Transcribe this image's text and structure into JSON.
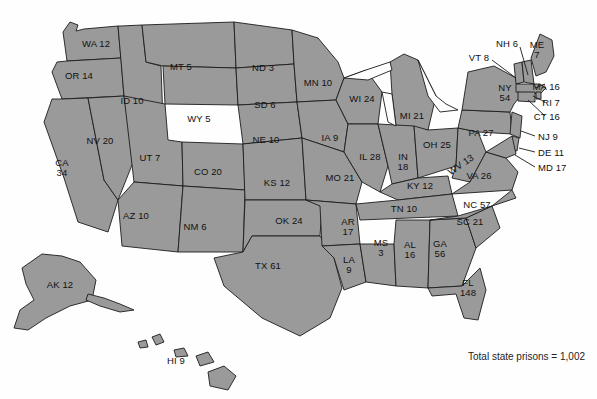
{
  "figure": {
    "caption": "Total state prisons = 1,002",
    "caption_x": 468,
    "caption_y": 351,
    "fill_color": "#9a9a9a",
    "border_color": "#1c1c1c",
    "background_color": "#fefefe",
    "water_color": "#fdfdfd"
  },
  "chart_data": {
    "type": "map",
    "title": "Total state prisons = 1,002",
    "subtitle": "",
    "xlabel": "",
    "ylabel": "",
    "value_unit": "state prisons",
    "total": 1002,
    "total_label": "Total state prisons = 1,002",
    "legend": "none",
    "grid": false,
    "projection": "albers-usa",
    "categories": [
      "AL",
      "AK",
      "AZ",
      "AR",
      "CA",
      "CO",
      "CT",
      "DE",
      "FL",
      "GA",
      "HI",
      "ID",
      "IL",
      "IN",
      "IA",
      "KS",
      "KY",
      "LA",
      "ME",
      "MD",
      "MA",
      "MI",
      "MN",
      "MS",
      "MO",
      "MT",
      "NE",
      "NV",
      "NH",
      "NJ",
      "NM",
      "NY",
      "NC",
      "ND",
      "OH",
      "OK",
      "OR",
      "PA",
      "RI",
      "SC",
      "SD",
      "TN",
      "TX",
      "UT",
      "VT",
      "VA",
      "WA",
      "WV",
      "WI",
      "WY"
    ],
    "values": [
      16,
      12,
      10,
      17,
      34,
      20,
      16,
      11,
      148,
      56,
      9,
      10,
      28,
      18,
      9,
      12,
      12,
      9,
      7,
      17,
      16,
      21,
      10,
      3,
      21,
      5,
      10,
      20,
      6,
      9,
      6,
      54,
      57,
      3,
      25,
      24,
      14,
      27,
      7,
      21,
      6,
      10,
      61,
      7,
      8,
      26,
      12,
      13,
      24,
      5
    ]
  },
  "states": [
    {
      "id": "WA",
      "label": "WA 12",
      "value": 12,
      "x": 96,
      "y": 44,
      "anchor": "ctr",
      "leader": null
    },
    {
      "id": "OR",
      "label": "OR 14",
      "value": 14,
      "x": 79,
      "y": 76,
      "anchor": "ctr",
      "leader": null
    },
    {
      "id": "CA",
      "label": "CA\n34",
      "value": 34,
      "x": 62,
      "y": 168,
      "anchor": "ctr",
      "leader": null
    },
    {
      "id": "NV",
      "label": "NV 20",
      "value": 20,
      "x": 100,
      "y": 141,
      "anchor": "ctr",
      "leader": null
    },
    {
      "id": "ID",
      "label": "ID 10",
      "value": 10,
      "x": 132,
      "y": 101,
      "anchor": "ctr",
      "leader": null
    },
    {
      "id": "MT",
      "label": "MT 5",
      "value": 5,
      "x": 181,
      "y": 67,
      "anchor": "ctr",
      "leader": null
    },
    {
      "id": "WY",
      "label": "WY 5",
      "value": 5,
      "x": 199,
      "y": 119,
      "anchor": "ctr",
      "leader": null
    },
    {
      "id": "UT",
      "label": "UT 7",
      "value": 7,
      "x": 150,
      "y": 158,
      "anchor": "ctr",
      "leader": null
    },
    {
      "id": "AZ",
      "label": "AZ 10",
      "value": 10,
      "x": 136,
      "y": 216,
      "anchor": "ctr",
      "leader": null
    },
    {
      "id": "CO",
      "label": "CO 20",
      "value": 20,
      "x": 208,
      "y": 172,
      "anchor": "ctr",
      "leader": null
    },
    {
      "id": "NM",
      "label": "NM 6",
      "value": 6,
      "x": 195,
      "y": 227,
      "anchor": "ctr",
      "leader": null
    },
    {
      "id": "ND",
      "label": "ND 3",
      "value": 3,
      "x": 263,
      "y": 68,
      "anchor": "ctr",
      "leader": null
    },
    {
      "id": "SD",
      "label": "SD 6",
      "value": 6,
      "x": 265,
      "y": 105,
      "anchor": "ctr",
      "leader": null
    },
    {
      "id": "NE",
      "label": "NE 10",
      "value": 10,
      "x": 266,
      "y": 140,
      "anchor": "ctr",
      "leader": null
    },
    {
      "id": "KS",
      "label": "KS 12",
      "value": 12,
      "x": 277,
      "y": 183,
      "anchor": "ctr",
      "leader": null
    },
    {
      "id": "OK",
      "label": "OK 24",
      "value": 24,
      "x": 289,
      "y": 221,
      "anchor": "ctr",
      "leader": null
    },
    {
      "id": "TX",
      "label": "TX 61",
      "value": 61,
      "x": 268,
      "y": 266,
      "anchor": "ctr",
      "leader": null
    },
    {
      "id": "MN",
      "label": "MN 10",
      "value": 10,
      "x": 318,
      "y": 83,
      "anchor": "ctr",
      "leader": null
    },
    {
      "id": "IA",
      "label": "IA 9",
      "value": 9,
      "x": 330,
      "y": 138,
      "anchor": "ctr",
      "leader": null
    },
    {
      "id": "MO",
      "label": "MO 21",
      "value": 21,
      "x": 340,
      "y": 178,
      "anchor": "ctr",
      "leader": null
    },
    {
      "id": "AR",
      "label": "AR\n17",
      "value": 17,
      "x": 348,
      "y": 227,
      "anchor": "ctr",
      "leader": null
    },
    {
      "id": "LA",
      "label": "LA\n9",
      "value": 9,
      "x": 349,
      "y": 265,
      "anchor": "ctr",
      "leader": null
    },
    {
      "id": "WI",
      "label": "WI 24",
      "value": 24,
      "x": 362,
      "y": 99,
      "anchor": "ctr",
      "leader": null
    },
    {
      "id": "IL",
      "label": "IL 28",
      "value": 28,
      "x": 370,
      "y": 157,
      "anchor": "ctr",
      "leader": null
    },
    {
      "id": "MS",
      "label": "MS\n3",
      "value": 3,
      "x": 381,
      "y": 248,
      "anchor": "ctr",
      "leader": null
    },
    {
      "id": "MI",
      "label": "MI 21",
      "value": 21,
      "x": 412,
      "y": 116,
      "anchor": "ctr",
      "leader": null
    },
    {
      "id": "IN",
      "label": "IN\n18",
      "value": 18,
      "x": 403,
      "y": 162,
      "anchor": "ctr",
      "leader": null
    },
    {
      "id": "KY",
      "label": "KY 12",
      "value": 12,
      "x": 420,
      "y": 186,
      "anchor": "ctr",
      "leader": null
    },
    {
      "id": "TN",
      "label": "TN 10",
      "value": 10,
      "x": 404,
      "y": 209,
      "anchor": "ctr",
      "leader": null
    },
    {
      "id": "AL",
      "label": "AL\n16",
      "value": 16,
      "x": 410,
      "y": 250,
      "anchor": "ctr",
      "leader": null
    },
    {
      "id": "OH",
      "label": "OH 25",
      "value": 25,
      "x": 437,
      "y": 145,
      "anchor": "ctr",
      "leader": null
    },
    {
      "id": "WV",
      "label": "WV 13",
      "value": 13,
      "x": 461,
      "y": 165,
      "anchor": "rot",
      "leader": null
    },
    {
      "id": "GA",
      "label": "GA\n56",
      "value": 56,
      "x": 440,
      "y": 249,
      "anchor": "ctr",
      "leader": null
    },
    {
      "id": "FL",
      "label": "FL\n148",
      "value": 148,
      "x": 468,
      "y": 288,
      "anchor": "ctr",
      "leader": null
    },
    {
      "id": "SC",
      "label": "SC 21",
      "value": 21,
      "x": 470,
      "y": 222,
      "anchor": "ctr",
      "leader": null
    },
    {
      "id": "NC",
      "label": "NC 57",
      "value": 57,
      "x": 477,
      "y": 205,
      "anchor": "ctr",
      "leader": null
    },
    {
      "id": "VA",
      "label": "VA 26",
      "value": 26,
      "x": 479,
      "y": 176,
      "anchor": "ctr",
      "leader": null
    },
    {
      "id": "PA",
      "label": "PA 27",
      "value": 27,
      "x": 481,
      "y": 133,
      "anchor": "ctr",
      "leader": null
    },
    {
      "id": "NY",
      "label": "NY\n54",
      "value": 54,
      "x": 505,
      "y": 93,
      "anchor": "ctr",
      "leader": null
    },
    {
      "id": "VT",
      "label": "VT 8",
      "value": 8,
      "x": 479,
      "y": 58,
      "anchor": "ctr",
      "leader": {
        "x1": 492,
        "y1": 60,
        "x2": 516,
        "y2": 78
      }
    },
    {
      "id": "NH",
      "label": "NH 6",
      "value": 6,
      "x": 507,
      "y": 44,
      "anchor": "ctr",
      "leader": {
        "x1": 520,
        "y1": 47,
        "x2": 528,
        "y2": 75
      }
    },
    {
      "id": "ME",
      "label": "ME\n7",
      "value": 7,
      "x": 537,
      "y": 50,
      "anchor": "ctr",
      "leader": null
    },
    {
      "id": "MA",
      "label": "MA 16",
      "value": 16,
      "x": 560,
      "y": 87,
      "anchor": "rgt",
      "leader": {
        "x1": 535,
        "y1": 88,
        "x2": 545,
        "y2": 84
      }
    },
    {
      "id": "RI",
      "label": "RI 7",
      "value": 7,
      "x": 560,
      "y": 103,
      "anchor": "rgt",
      "leader": {
        "x1": 533,
        "y1": 96,
        "x2": 545,
        "y2": 102
      }
    },
    {
      "id": "CT",
      "label": "CT 16",
      "value": 16,
      "x": 560,
      "y": 117,
      "anchor": "rgt",
      "leader": {
        "x1": 528,
        "y1": 100,
        "x2": 545,
        "y2": 116
      }
    },
    {
      "id": "NJ",
      "label": "NJ 9",
      "value": 9,
      "x": 538,
      "y": 137,
      "anchor": "lft",
      "leader": {
        "x1": 521,
        "y1": 131,
        "x2": 535,
        "y2": 136
      }
    },
    {
      "id": "DE",
      "label": "DE 11",
      "value": 11,
      "x": 538,
      "y": 153,
      "anchor": "lft",
      "leader": {
        "x1": 519,
        "y1": 148,
        "x2": 535,
        "y2": 152
      }
    },
    {
      "id": "MD",
      "label": "MD 17",
      "value": 17,
      "x": 538,
      "y": 168,
      "anchor": "lft",
      "leader": {
        "x1": 515,
        "y1": 155,
        "x2": 535,
        "y2": 167
      }
    },
    {
      "id": "AK",
      "label": "AK 12",
      "value": 12,
      "x": 60,
      "y": 285,
      "anchor": "ctr",
      "leader": null
    },
    {
      "id": "HI",
      "label": "HI 9",
      "value": 9,
      "x": 176,
      "y": 361,
      "anchor": "ctr",
      "leader": null
    }
  ]
}
